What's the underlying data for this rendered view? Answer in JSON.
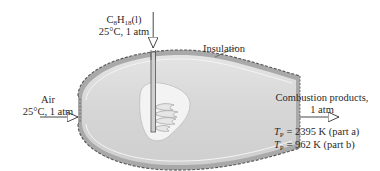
{
  "figure": {
    "type": "combustion chamber schematic",
    "fuel_inlet": {
      "species_prefix": "C",
      "species_sub1": "8",
      "species_mid": "H",
      "species_sub2": "18",
      "species_suffix": "(l)",
      "conditions": "25°C, 1 atm"
    },
    "insulation_label": "Insulation",
    "air_inlet": {
      "name": "Air",
      "conditions": "25°C, 1 atm"
    },
    "exhaust": {
      "name": "Combustion products,",
      "pressure": "1 atm",
      "results": [
        {
          "symbol": "T",
          "subscript": "P",
          "value": "= 2395 K (part a)"
        },
        {
          "symbol": "T",
          "subscript": "P",
          "value": "= 962 K (part b)"
        }
      ]
    },
    "colors": {
      "chamber_fill": "#d9d9d9",
      "insulation": "#a8a8a8",
      "outline": "#555555",
      "flame_region": "#f2f2f2",
      "text": "#2a2a2a"
    }
  }
}
